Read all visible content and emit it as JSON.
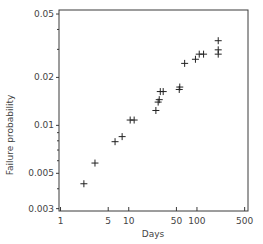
{
  "chart_data": {
    "type": "scatter",
    "title": "",
    "xlabel": "Days",
    "ylabel": "Failure probability",
    "xscale": "log",
    "yscale": "log",
    "xlim": [
      0.95,
      560
    ],
    "ylim": [
      0.0029,
      0.053
    ],
    "x_ticks": [
      1,
      5,
      10,
      50,
      100,
      500
    ],
    "x_tick_labels": [
      "1",
      "5",
      "10",
      "50",
      "100",
      "500"
    ],
    "y_ticks": [
      0.003,
      0.005,
      0.01,
      0.02,
      0.05
    ],
    "y_tick_labels": [
      "0.003",
      "0.005",
      "0.01",
      "0.02",
      "0.05"
    ],
    "y_minor_ticks": [
      0.004,
      0.006,
      0.007,
      0.008,
      0.009,
      0.03,
      0.04
    ],
    "grid": false,
    "legend": "none",
    "marker": "+",
    "points": [
      {
        "x": 2.2,
        "y": 0.0043
      },
      {
        "x": 3.2,
        "y": 0.0058
      },
      {
        "x": 6.3,
        "y": 0.0079
      },
      {
        "x": 8.0,
        "y": 0.0085
      },
      {
        "x": 10.5,
        "y": 0.0108
      },
      {
        "x": 12.0,
        "y": 0.0108
      },
      {
        "x": 25,
        "y": 0.0124
      },
      {
        "x": 27,
        "y": 0.014
      },
      {
        "x": 28,
        "y": 0.0145
      },
      {
        "x": 29,
        "y": 0.0163
      },
      {
        "x": 32,
        "y": 0.0163
      },
      {
        "x": 55,
        "y": 0.0168
      },
      {
        "x": 56,
        "y": 0.0174
      },
      {
        "x": 66,
        "y": 0.0245
      },
      {
        "x": 95,
        "y": 0.026
      },
      {
        "x": 108,
        "y": 0.028
      },
      {
        "x": 125,
        "y": 0.028
      },
      {
        "x": 205,
        "y": 0.028
      },
      {
        "x": 205,
        "y": 0.0298
      },
      {
        "x": 205,
        "y": 0.034
      }
    ]
  }
}
